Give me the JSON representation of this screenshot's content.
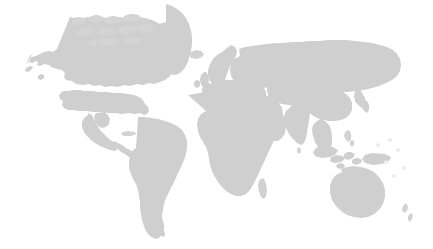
{
  "figure": {
    "kind": "world-map-silhouette",
    "title": "",
    "caption": "",
    "width": 433,
    "height": 249,
    "projection": "equirectangular",
    "has_text_labels": false,
    "has_markers": false,
    "has_graticule": false,
    "has_border": false
  },
  "colors": {
    "background": "#ffffff",
    "land_fill": "#cfcfcf",
    "land_fill_light": "#dcdcdc",
    "land_fill_faint": "#e9e9e9"
  },
  "regions": [
    {
      "id": "alaska",
      "name": "Alaska"
    },
    {
      "id": "canada",
      "name": "Canada"
    },
    {
      "id": "canadian-arctic",
      "name": "Canadian Arctic Archipelago"
    },
    {
      "id": "greenland",
      "name": "Greenland"
    },
    {
      "id": "united-states",
      "name": "United States"
    },
    {
      "id": "mexico",
      "name": "Mexico"
    },
    {
      "id": "central-america",
      "name": "Central America"
    },
    {
      "id": "caribbean",
      "name": "Caribbean Islands"
    },
    {
      "id": "south-america",
      "name": "South America"
    },
    {
      "id": "iceland",
      "name": "Iceland"
    },
    {
      "id": "british-isles",
      "name": "British Isles"
    },
    {
      "id": "scandinavia",
      "name": "Scandinavia"
    },
    {
      "id": "europe",
      "name": "Continental Europe"
    },
    {
      "id": "mediterranean",
      "name": "Mediterranean"
    },
    {
      "id": "africa",
      "name": "Africa"
    },
    {
      "id": "madagascar",
      "name": "Madagascar"
    },
    {
      "id": "middle-east",
      "name": "Middle East"
    },
    {
      "id": "arabian-peninsula",
      "name": "Arabian Peninsula"
    },
    {
      "id": "russia",
      "name": "Russia"
    },
    {
      "id": "siberia",
      "name": "Siberia"
    },
    {
      "id": "central-asia",
      "name": "Central Asia"
    },
    {
      "id": "india",
      "name": "India"
    },
    {
      "id": "sri-lanka",
      "name": "Sri Lanka"
    },
    {
      "id": "china",
      "name": "China"
    },
    {
      "id": "korea-japan",
      "name": "Korea and Japan"
    },
    {
      "id": "southeast-asia",
      "name": "Southeast Asia"
    },
    {
      "id": "indonesia",
      "name": "Indonesia"
    },
    {
      "id": "philippines",
      "name": "Philippines"
    },
    {
      "id": "new-guinea",
      "name": "New Guinea"
    },
    {
      "id": "australia",
      "name": "Australia"
    },
    {
      "id": "new-zealand",
      "name": "New Zealand"
    },
    {
      "id": "pacific-islands",
      "name": "Pacific Islands"
    }
  ]
}
